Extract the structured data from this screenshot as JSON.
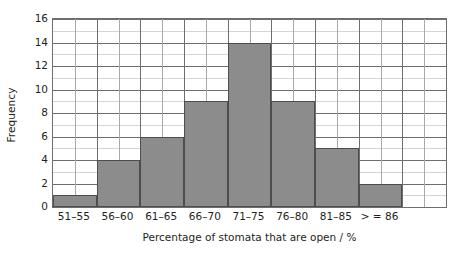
{
  "chart_data": {
    "type": "bar",
    "title": "",
    "subtitle": "",
    "categories": [
      "51–55",
      "56–60",
      "61–65",
      "66–70",
      "71–75",
      "76–80",
      "81–85",
      "> = 86"
    ],
    "values": [
      1,
      4,
      6,
      9,
      14,
      9,
      5,
      2
    ],
    "xlabel": "Percentage of stomata that are open / %",
    "ylabel": "Frequency",
    "ylim": [
      0,
      16
    ],
    "ytick_labels": [
      "0",
      "2",
      "4",
      "6",
      "8",
      "10",
      "12",
      "14",
      "16"
    ],
    "ytick_values": [
      0,
      2,
      4,
      6,
      8,
      10,
      12,
      14,
      16
    ],
    "ytick_step": 2,
    "minor_y_step": 1,
    "grid": "major and minor horizontal, major and minor vertical",
    "legend": "none",
    "bar_fill_color": "#8c8c8c",
    "bar_edge_color": "#4d4d4f",
    "grid_major_color": "#6d6e71",
    "grid_minor_color": "#a7a9ac",
    "axis_color": "#6d6e71",
    "text_color": "#231f20",
    "background_color": "#ffffff",
    "bars_per_grid_column": 2,
    "empty_grid_columns_right": 2,
    "total_grid_columns": 18
  }
}
